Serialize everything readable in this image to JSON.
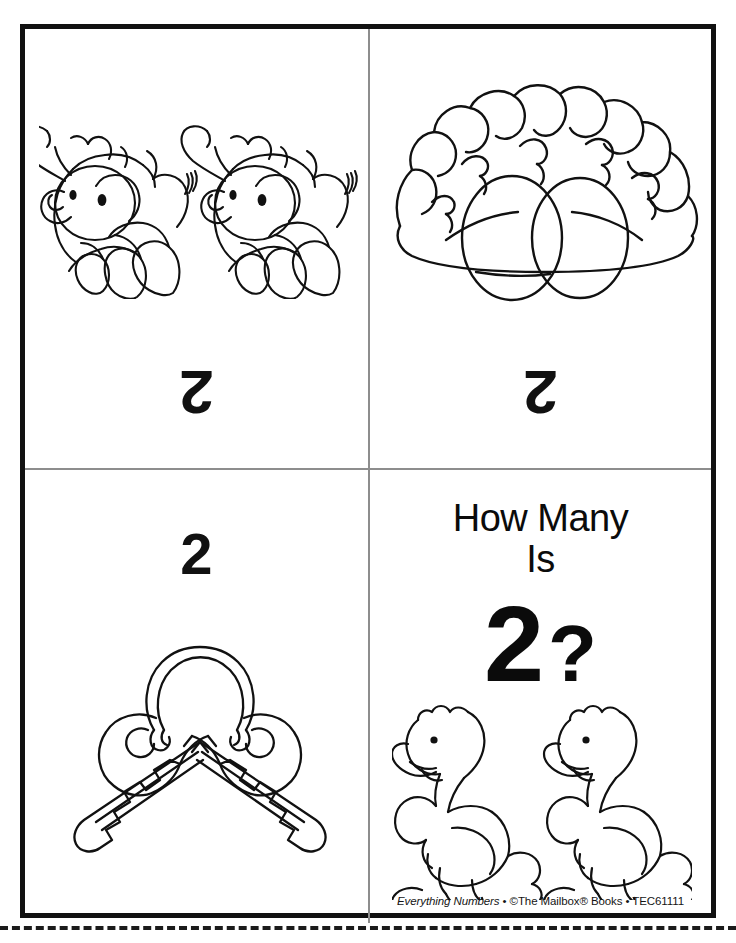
{
  "worksheet": {
    "title": "How Many Is 2?",
    "theme_number": "2",
    "cut_line": "dashed-cut-line"
  },
  "cells": {
    "top_left": {
      "name": "elephants-card",
      "illustration": "two-elephants",
      "illustration_count": 2,
      "numeral": "2",
      "numeral_orientation": "upside-down"
    },
    "top_right": {
      "name": "nest-eggs-card",
      "illustration": "nest-with-two-eggs",
      "illustration_count": 2,
      "numeral": "2",
      "numeral_orientation": "upside-down"
    },
    "bottom_left": {
      "name": "keys-card",
      "illustration": "two-keys-on-ring",
      "illustration_count": 2,
      "numeral": "2",
      "numeral_orientation": "upright"
    },
    "bottom_right": {
      "name": "cover-card",
      "heading_line1": "How Many",
      "heading_line2": "Is",
      "question_numeral": "2",
      "question_mark": "?",
      "illustration": "two-ducks",
      "illustration_count": 2
    }
  },
  "footer": {
    "book_title": "Everything Numbers",
    "separator_1": " • ",
    "publisher": "©The Mailbox® Books",
    "separator_2": " • ",
    "product_code": "TEC61111"
  },
  "colors": {
    "page_background": "#ffffff",
    "frame_border": "#111111",
    "divider": "#8d8d8d",
    "ink": "#111111",
    "cut_line": "#1b1b1b"
  }
}
